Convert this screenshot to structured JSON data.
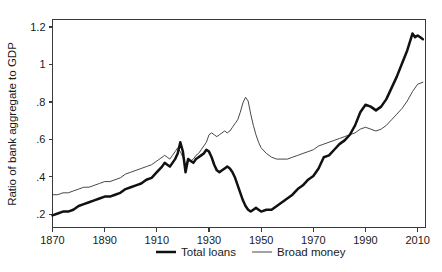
{
  "chart_data": {
    "type": "line",
    "title": "",
    "xlabel": "",
    "ylabel": "Ratio of bank aggregate to GDP",
    "xlim": [
      1870,
      2013
    ],
    "ylim": [
      0.13,
      1.24
    ],
    "xticks": [
      1870,
      1890,
      1910,
      1930,
      1950,
      1970,
      1990,
      2010
    ],
    "xticklabels": [
      "1870",
      "1890",
      "1910",
      "1930",
      "1950",
      "1970",
      "1990",
      "2010"
    ],
    "yticks": [
      0.2,
      0.4,
      0.6,
      0.8,
      1.0,
      1.2
    ],
    "yticklabels": [
      ".2",
      ".4",
      ".6",
      ".8",
      "1",
      "1.2"
    ],
    "grid": false,
    "legend_position": "below-axis",
    "series": [
      {
        "name": "Total loans",
        "color": "#111111",
        "linewidth": 2.5,
        "x": [
          1870,
          1872,
          1874,
          1876,
          1878,
          1880,
          1882,
          1884,
          1886,
          1888,
          1890,
          1892,
          1894,
          1896,
          1898,
          1900,
          1902,
          1904,
          1906,
          1908,
          1910,
          1912,
          1913,
          1914,
          1915,
          1916,
          1917,
          1918,
          1919,
          1920,
          1921,
          1922,
          1923,
          1924,
          1925,
          1926,
          1927,
          1928,
          1929,
          1930,
          1931,
          1932,
          1933,
          1934,
          1935,
          1936,
          1937,
          1938,
          1939,
          1940,
          1941,
          1942,
          1943,
          1944,
          1945,
          1946,
          1947,
          1948,
          1949,
          1950,
          1952,
          1954,
          1956,
          1958,
          1960,
          1962,
          1964,
          1966,
          1968,
          1970,
          1972,
          1974,
          1976,
          1978,
          1980,
          1982,
          1984,
          1986,
          1988,
          1990,
          1992,
          1994,
          1996,
          1998,
          2000,
          2002,
          2004,
          2006,
          2008,
          2009,
          2010,
          2011,
          2012
        ],
        "y": [
          0.195,
          0.205,
          0.215,
          0.215,
          0.225,
          0.245,
          0.255,
          0.265,
          0.275,
          0.285,
          0.295,
          0.295,
          0.305,
          0.315,
          0.335,
          0.345,
          0.355,
          0.365,
          0.385,
          0.395,
          0.425,
          0.455,
          0.475,
          0.465,
          0.455,
          0.475,
          0.495,
          0.525,
          0.585,
          0.535,
          0.425,
          0.495,
          0.485,
          0.475,
          0.495,
          0.505,
          0.515,
          0.525,
          0.545,
          0.535,
          0.505,
          0.465,
          0.435,
          0.425,
          0.435,
          0.445,
          0.455,
          0.445,
          0.425,
          0.395,
          0.355,
          0.315,
          0.275,
          0.245,
          0.225,
          0.215,
          0.225,
          0.235,
          0.225,
          0.215,
          0.225,
          0.225,
          0.245,
          0.265,
          0.285,
          0.305,
          0.335,
          0.355,
          0.385,
          0.405,
          0.445,
          0.505,
          0.515,
          0.545,
          0.575,
          0.595,
          0.625,
          0.675,
          0.745,
          0.785,
          0.775,
          0.755,
          0.775,
          0.815,
          0.875,
          0.935,
          1.005,
          1.075,
          1.165,
          1.145,
          1.155,
          1.145,
          1.135
        ]
      },
      {
        "name": "Broad money",
        "color": "#333333",
        "linewidth": 0.9,
        "x": [
          1870,
          1872,
          1874,
          1876,
          1878,
          1880,
          1882,
          1884,
          1886,
          1888,
          1890,
          1892,
          1894,
          1896,
          1898,
          1900,
          1902,
          1904,
          1906,
          1908,
          1910,
          1912,
          1913,
          1914,
          1915,
          1916,
          1917,
          1918,
          1919,
          1920,
          1921,
          1922,
          1923,
          1924,
          1925,
          1926,
          1927,
          1928,
          1929,
          1930,
          1931,
          1932,
          1933,
          1934,
          1935,
          1936,
          1937,
          1938,
          1939,
          1940,
          1941,
          1942,
          1943,
          1944,
          1945,
          1946,
          1947,
          1948,
          1949,
          1950,
          1952,
          1954,
          1956,
          1958,
          1960,
          1962,
          1964,
          1966,
          1968,
          1970,
          1972,
          1974,
          1976,
          1978,
          1980,
          1982,
          1984,
          1986,
          1988,
          1990,
          1992,
          1994,
          1996,
          1998,
          2000,
          2002,
          2004,
          2006,
          2008,
          2010,
          2012
        ],
        "y": [
          0.305,
          0.305,
          0.315,
          0.315,
          0.325,
          0.335,
          0.345,
          0.345,
          0.355,
          0.365,
          0.375,
          0.375,
          0.385,
          0.395,
          0.415,
          0.425,
          0.435,
          0.445,
          0.455,
          0.465,
          0.485,
          0.505,
          0.515,
          0.505,
          0.495,
          0.515,
          0.535,
          0.555,
          0.535,
          0.505,
          0.465,
          0.495,
          0.485,
          0.495,
          0.515,
          0.525,
          0.545,
          0.565,
          0.585,
          0.625,
          0.635,
          0.625,
          0.615,
          0.625,
          0.635,
          0.645,
          0.635,
          0.645,
          0.665,
          0.685,
          0.705,
          0.745,
          0.795,
          0.825,
          0.805,
          0.735,
          0.675,
          0.625,
          0.585,
          0.555,
          0.525,
          0.505,
          0.495,
          0.495,
          0.495,
          0.505,
          0.515,
          0.525,
          0.535,
          0.545,
          0.565,
          0.575,
          0.585,
          0.595,
          0.605,
          0.615,
          0.625,
          0.635,
          0.655,
          0.665,
          0.655,
          0.645,
          0.655,
          0.675,
          0.705,
          0.735,
          0.765,
          0.805,
          0.855,
          0.895,
          0.905
        ]
      }
    ]
  },
  "legend": {
    "items": [
      {
        "label": "Total loans",
        "style": "thick"
      },
      {
        "label": "Broad money",
        "style": "thin"
      }
    ]
  }
}
